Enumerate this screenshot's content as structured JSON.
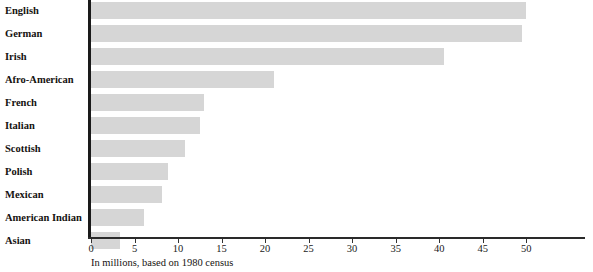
{
  "chart_data": {
    "type": "bar",
    "orientation": "horizontal",
    "title": "",
    "subtitle": "",
    "xlabel": "In millions, based on 1980 census",
    "ylabel": "",
    "categories": [
      "English",
      "German",
      "Irish",
      "Afro-American",
      "French",
      "Italian",
      "Scottish",
      "Polish",
      "Mexican",
      "American Indian",
      "Asian"
    ],
    "values": [
      50.0,
      49.5,
      40.5,
      21.0,
      13.0,
      12.5,
      10.8,
      8.9,
      8.1,
      6.1,
      3.3
    ],
    "xlim": [
      0,
      54
    ],
    "xticks": [
      0,
      5,
      10,
      15,
      20,
      25,
      30,
      35,
      40,
      45,
      50
    ],
    "xtick_labels": [
      "0",
      "5",
      "10",
      "15",
      "20",
      "25",
      "30",
      "35",
      "40",
      "45",
      "50"
    ],
    "grid": false,
    "legend": false,
    "legend_position": "none",
    "bar_color": "#d6d6d6",
    "axis_color": "#1a1a1a",
    "text_color": "#15120f",
    "background_color": "#ffffff"
  }
}
